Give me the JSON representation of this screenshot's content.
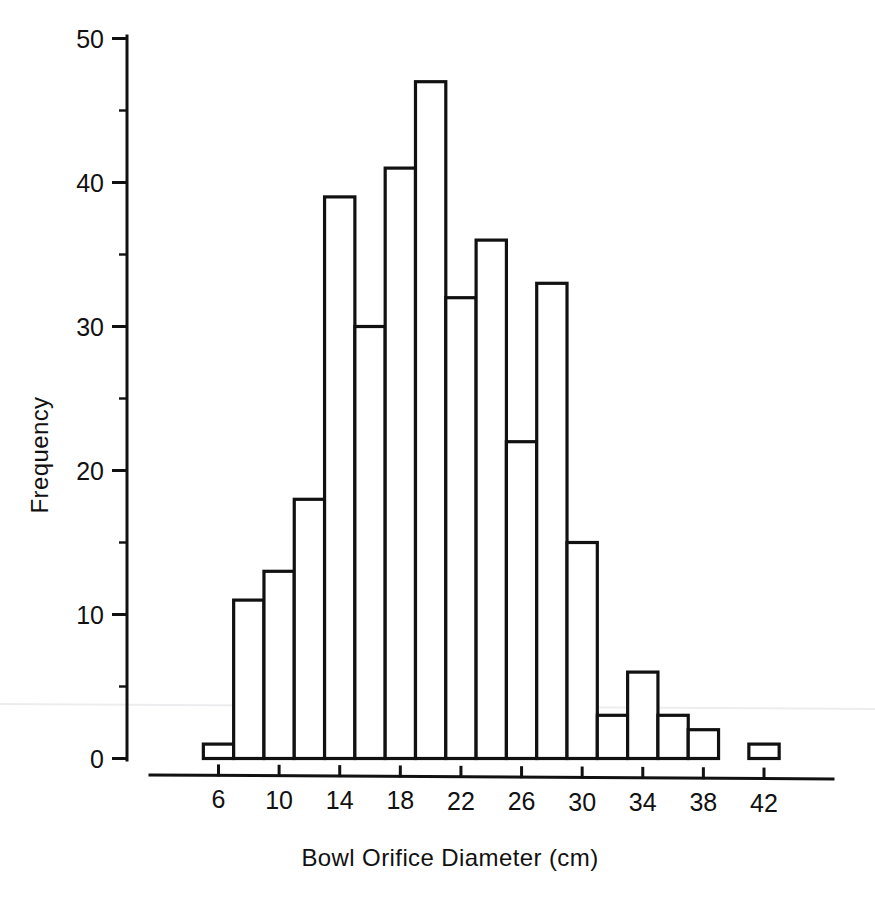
{
  "figure": {
    "background_color": "#ffffff",
    "ink_color": "#111111"
  },
  "axes": {
    "x_title": "Bowl Orifice Diameter (cm)",
    "y_title": "Frequency",
    "x_ticks": [
      "6",
      "10",
      "14",
      "18",
      "22",
      "26",
      "30",
      "34",
      "38",
      "42"
    ],
    "y_ticks": [
      "0",
      "10",
      "20",
      "30",
      "40",
      "50"
    ]
  },
  "chart_data": {
    "type": "bar",
    "title": "",
    "subtitle": "",
    "xlabel": "Bowl Orifice Diameter (cm)",
    "ylabel": "Frequency",
    "xlim": [
      4,
      44
    ],
    "ylim": [
      0,
      50
    ],
    "grid": false,
    "legend": null,
    "bin_width": 2,
    "categories": [
      "6",
      "8",
      "10",
      "12",
      "14",
      "16",
      "18",
      "20",
      "22",
      "24",
      "26",
      "28",
      "30",
      "32",
      "34",
      "36",
      "38",
      "40",
      "42"
    ],
    "bin_edges": [
      5,
      7,
      9,
      11,
      13,
      15,
      17,
      19,
      21,
      23,
      25,
      27,
      29,
      31,
      33,
      35,
      37,
      39,
      41,
      43
    ],
    "values": [
      1,
      11,
      13,
      18,
      39,
      30,
      41,
      47,
      32,
      36,
      22,
      33,
      15,
      3,
      6,
      3,
      2,
      0,
      1
    ],
    "x_tick_values": [
      6,
      10,
      14,
      18,
      22,
      26,
      30,
      34,
      38,
      42
    ],
    "y_tick_values": [
      0,
      10,
      20,
      30,
      40,
      50
    ],
    "y_minor_tick_values": [
      5,
      15,
      25,
      35,
      45
    ],
    "total_count": 353,
    "annotations": []
  }
}
